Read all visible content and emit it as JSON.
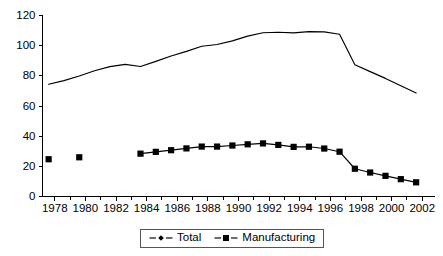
{
  "chart_data": {
    "type": "line",
    "title": "",
    "subtitle": "",
    "xlabel": "",
    "ylabel": "",
    "xlim": [
      1977.2,
      2002.8
    ],
    "ylim": [
      0,
      120
    ],
    "grid": false,
    "legend_position": "bottom-center",
    "y_ticks": [
      0,
      20,
      40,
      60,
      80,
      100,
      120
    ],
    "y_tick_labels": [
      "0",
      "20",
      "40",
      "60",
      "80",
      "100",
      "120"
    ],
    "x_ticks": [
      1978,
      1980,
      1982,
      1984,
      1986,
      1988,
      1990,
      1992,
      1994,
      1996,
      1998,
      2000,
      2002
    ],
    "x_tick_labels": [
      "1978",
      "1980",
      "1982",
      "1984",
      "1986",
      "1988",
      "1990",
      "1992",
      "1994",
      "1996",
      "1998",
      "2000",
      "2002"
    ],
    "x_minor_ticks": [
      1979,
      1981,
      1983,
      1985,
      1987,
      1989,
      1991,
      1993,
      1995,
      1997,
      1999,
      2001
    ],
    "series": [
      {
        "name": "Total",
        "marker": "diamond",
        "color": "#000000",
        "x": [
          1977.6,
          1978.6,
          1979.6,
          1980.6,
          1981.6,
          1982.6,
          1983.6,
          1984.6,
          1985.6,
          1986.6,
          1987.6,
          1988.6,
          1989.6,
          1990.6,
          1991.6,
          1992.6,
          1993.6,
          1994.6,
          1995.6,
          1996.6,
          1997.6,
          1998.6,
          1999.6,
          2000.6,
          2001.6
        ],
        "values": [
          74.4,
          76.8,
          79.9,
          83.4,
          86.1,
          87.6,
          86.2,
          89.6,
          93.1,
          96.2,
          99.6,
          100.8,
          103.2,
          106.3,
          108.6,
          108.9,
          108.5,
          109.3,
          109.1,
          107.6,
          87.4,
          82.8,
          78.3,
          73.4,
          68.6
        ]
      },
      {
        "name": "Manufacturing",
        "marker": "square",
        "color": "#000000",
        "x": [
          1977.6,
          1979.6,
          1983.6,
          1984.6,
          1985.6,
          1986.6,
          1987.6,
          1988.6,
          1989.6,
          1990.6,
          1991.6,
          1992.6,
          1993.6,
          1994.6,
          1995.6,
          1996.6,
          1997.6,
          1998.6,
          1999.6,
          2000.6,
          2001.6
        ],
        "values": [
          24.7,
          26.0,
          28.4,
          29.6,
          30.7,
          31.9,
          33.1,
          33.1,
          33.8,
          34.6,
          35.2,
          34.2,
          32.9,
          33.0,
          31.8,
          29.7,
          18.4,
          15.9,
          13.7,
          11.5,
          9.4
        ],
        "connect_from_index": 2
      }
    ]
  },
  "legend": {
    "items": [
      {
        "label": "Total",
        "marker": "diamond"
      },
      {
        "label": "Manufacturing",
        "marker": "square"
      }
    ]
  }
}
